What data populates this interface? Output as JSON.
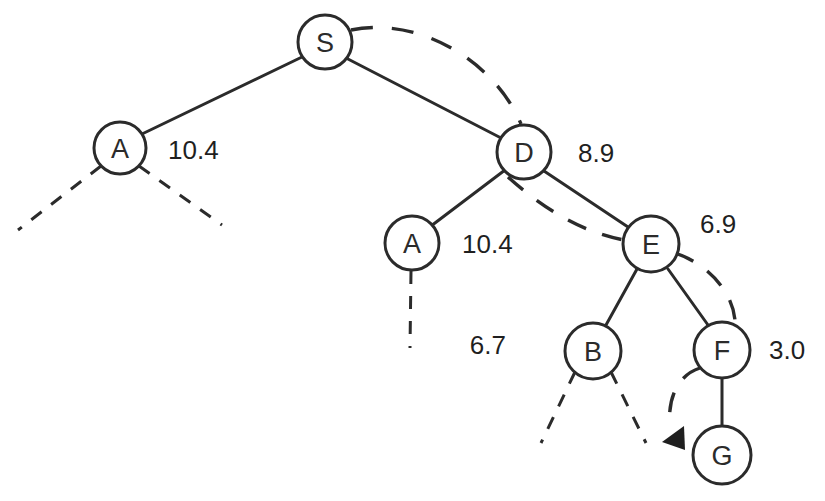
{
  "diagram": {
    "type": "tree-graph",
    "colors": {
      "stroke": "#2b2b2b",
      "background": "#ffffff",
      "text": "#1f1f1f"
    },
    "nodes": [
      {
        "id": "S",
        "label": "S",
        "cx": 325,
        "cy": 42,
        "r": 27
      },
      {
        "id": "A1",
        "label": "A",
        "cx": 120,
        "cy": 148,
        "r": 26
      },
      {
        "id": "D",
        "label": "D",
        "cx": 524,
        "cy": 152,
        "r": 27
      },
      {
        "id": "A2",
        "label": "A",
        "cx": 412,
        "cy": 243,
        "r": 27
      },
      {
        "id": "E",
        "label": "E",
        "cx": 651,
        "cy": 244,
        "r": 28
      },
      {
        "id": "B",
        "label": "B",
        "cx": 593,
        "cy": 351,
        "r": 28
      },
      {
        "id": "F",
        "label": "F",
        "cx": 722,
        "cy": 350,
        "r": 28
      },
      {
        "id": "G",
        "label": "G",
        "cx": 722,
        "cy": 455,
        "r": 29
      }
    ],
    "cost_labels": [
      {
        "for": "A1",
        "value": "10.4",
        "x": 168,
        "y": 150
      },
      {
        "for": "D",
        "value": "8.9",
        "x": 578,
        "y": 153
      },
      {
        "for": "A2",
        "value": "10.4",
        "x": 462,
        "y": 244
      },
      {
        "for": "E",
        "value": "6.9",
        "x": 700,
        "y": 224
      },
      {
        "for": "B",
        "value": "6.7",
        "x": 506,
        "y": 345
      },
      {
        "for": "F",
        "value": "3.0",
        "x": 769,
        "y": 350
      }
    ],
    "solid_edges": [
      {
        "from": "S",
        "to": "A1"
      },
      {
        "from": "S",
        "to": "D"
      },
      {
        "from": "D",
        "to": "A2"
      },
      {
        "from": "D",
        "to": "E"
      },
      {
        "from": "E",
        "to": "B"
      },
      {
        "from": "E",
        "to": "F"
      },
      {
        "from": "F",
        "to": "G"
      }
    ],
    "dashed_frontier_edges": [
      {
        "from": "A1",
        "to_point": [
          18,
          230
        ]
      },
      {
        "from": "A1",
        "to_point": [
          222,
          225
        ]
      },
      {
        "from": "A2",
        "to_point": [
          410,
          348
        ]
      },
      {
        "from": "B",
        "to_point": [
          541,
          443
        ]
      },
      {
        "from": "B",
        "to_point": [
          646,
          443
        ]
      }
    ],
    "traced_path": {
      "sequence": [
        "S",
        "D",
        "E",
        "F",
        "G"
      ],
      "style": "dashed-curve",
      "arrow_target": "G",
      "arrow_direction": "down-left"
    }
  }
}
